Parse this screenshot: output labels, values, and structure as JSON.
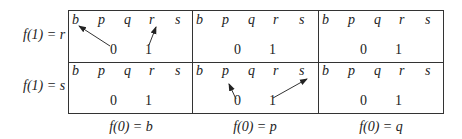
{
  "row_labels": [
    "f(1) = r",
    "f(1) = s"
  ],
  "col_labels": [
    "f(0) = b",
    "f(0) = p",
    "f(0) = q"
  ],
  "cell_letters": [
    "b",
    "p",
    "q",
    "r",
    "s"
  ],
  "cell_numbers": [
    "0",
    "1"
  ],
  "arrows": [
    {
      "cell": "row0-col0",
      "from": "0",
      "to": "b"
    },
    {
      "cell": "row0-col0",
      "from": "1",
      "to": "r"
    },
    {
      "cell": "row1-col1",
      "from": "0",
      "to": "p"
    },
    {
      "cell": "row1-col1",
      "from": "1",
      "to": "s"
    }
  ]
}
